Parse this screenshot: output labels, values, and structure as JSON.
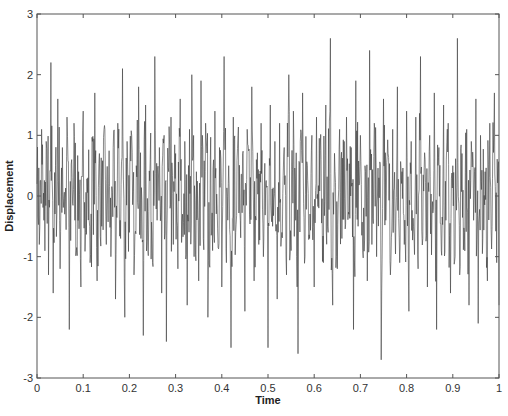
{
  "chart_data": {
    "type": "line",
    "title": "",
    "xlabel": "Time",
    "ylabel": "Displacement",
    "xlim": [
      0,
      1
    ],
    "ylim": [
      -3,
      3
    ],
    "xticks": [
      0,
      0.1,
      0.2,
      0.3,
      0.4,
      0.5,
      0.6,
      0.7,
      0.8,
      0.9,
      1
    ],
    "xtick_labels": [
      "0",
      "0.1",
      "0.2",
      "0.3",
      "0.4",
      "0.5",
      "0.6",
      "0.7",
      "0.8",
      "0.9",
      "1"
    ],
    "yticks": [
      -3,
      -2,
      -1,
      0,
      1,
      2,
      3
    ],
    "ytick_labels": [
      "-3",
      "-2",
      "-1",
      "0",
      "1",
      "2",
      "3"
    ],
    "grid": false,
    "legend": null,
    "line_color": "#3a3a3a",
    "series": [
      {
        "name": "displacement",
        "description": "dense random-noise signal, ~1000 samples, values mostly within ±1.5, occasional spikes to ±2.7",
        "x_step": 0.005,
        "values": [
          0.2,
          -0.8,
          1.1,
          -0.4,
          0.9,
          -1.3,
          2.2,
          -1.6,
          0.5,
          1.6,
          -1.2,
          0.8,
          -0.3,
          1.3,
          -2.2,
          0.6,
          1.2,
          -0.9,
          0.4,
          -1.5,
          1.4,
          -0.6,
          0.3,
          -1.1,
          0.9,
          1.7,
          -1.4,
          0.7,
          -0.5,
          1.1,
          -0.8,
          0.2,
          -1.0,
          0.8,
          -1.7,
          1.2,
          -0.4,
          2.1,
          -2.0,
          0.9,
          -0.6,
          1.0,
          -1.3,
          0.5,
          1.8,
          -0.7,
          -2.3,
          1.5,
          -0.9,
          0.6,
          -1.1,
          2.3,
          -0.4,
          0.8,
          -1.6,
          1.0,
          -2.4,
          0.4,
          1.3,
          -0.8,
          0.7,
          -1.2,
          1.6,
          -0.3,
          0.9,
          -1.8,
          1.1,
          -0.5,
          2.0,
          -1.0,
          0.4,
          -1.4,
          1.9,
          -0.7,
          1.2,
          -2.0,
          0.6,
          -0.9,
          1.4,
          -0.2,
          0.8,
          -1.5,
          2.3,
          -1.1,
          0.5,
          -2.5,
          1.3,
          -0.6,
          1.0,
          -0.4,
          0.7,
          -1.9,
          1.1,
          -0.3,
          1.8,
          -1.4,
          0.6,
          -0.8,
          1.2,
          -1.0,
          0.2,
          -2.5,
          1.5,
          -0.5,
          0.9,
          -1.7,
          1.2,
          -0.6,
          0.8,
          -1.3,
          2.0,
          -0.9,
          1.4,
          -0.4,
          -2.6,
          0.9,
          1.7,
          -1.0,
          0.5,
          -0.7,
          1.0,
          -1.5,
          1.3,
          -0.2,
          0.6,
          -1.1,
          1.5,
          -0.6,
          2.6,
          -1.8,
          0.4,
          -1.2,
          1.1,
          -0.7,
          0.9,
          -1.6,
          1.3,
          -0.3,
          0.8,
          -2.2,
          1.9,
          -0.5,
          1.0,
          -0.9,
          0.5,
          -1.4,
          2.4,
          -0.8,
          1.2,
          -1.0,
          0.3,
          -2.7,
          1.6,
          -0.4,
          0.7,
          -1.3,
          1.1,
          -0.6,
          1.8,
          -1.1,
          0.4,
          -0.8,
          1.4,
          -1.9,
          0.9,
          -0.5,
          1.3,
          -1.2,
          2.3,
          -0.7,
          0.6,
          -1.5,
          1.0,
          -0.3,
          1.7,
          -2.2,
          0.8,
          -0.9,
          1.5,
          -0.4,
          1.2,
          -1.6,
          0.5,
          -1.0,
          2.6,
          -1.3,
          0.7,
          -0.6,
          1.1,
          -1.8,
          0.9,
          -0.4,
          1.6,
          -2.1,
          1.0,
          -0.7,
          0.4,
          -1.4,
          1.2,
          -0.5,
          1.7,
          -1.1,
          0.8,
          -1.8
        ]
      }
    ]
  }
}
